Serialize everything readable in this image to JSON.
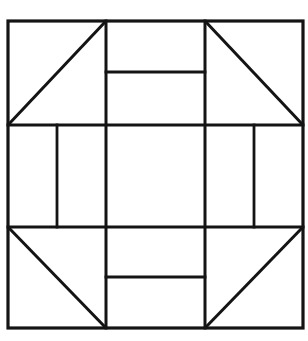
{
  "figure": {
    "background_color": "#ffffff",
    "line_color": "#141414",
    "canvas": {
      "width": 308,
      "height": 341
    },
    "bounds": {
      "left": 8,
      "top": 21,
      "right": 303,
      "bottom": 328
    },
    "grid": {
      "vertical_x": [
        106,
        205
      ],
      "horizontal_y": [
        125,
        227
      ]
    },
    "outer_border": {
      "name": "outer-square",
      "x": 8,
      "y": 21,
      "width": 295,
      "height": 307
    },
    "major_gridlines": [
      {
        "name": "horizontal-upper",
        "x1": 8,
        "y1": 125,
        "x2": 303,
        "y2": 125
      },
      {
        "name": "horizontal-lower",
        "x1": 8,
        "y1": 227,
        "x2": 303,
        "y2": 227
      },
      {
        "name": "vertical-left",
        "x1": 106,
        "y1": 21,
        "x2": 106,
        "y2": 328
      },
      {
        "name": "vertical-right",
        "x1": 205,
        "y1": 21,
        "x2": 205,
        "y2": 328
      }
    ],
    "diagonals": [
      {
        "name": "top-left-diagonal",
        "x1": 8,
        "y1": 125,
        "x2": 106,
        "y2": 21
      },
      {
        "name": "top-right-diagonal",
        "x1": 205,
        "y1": 21,
        "x2": 303,
        "y2": 125
      },
      {
        "name": "bottom-left-diagonal",
        "x1": 8,
        "y1": 227,
        "x2": 106,
        "y2": 328
      },
      {
        "name": "bottom-right-diagonal",
        "x1": 205,
        "y1": 328,
        "x2": 303,
        "y2": 227
      }
    ],
    "inner_bars": [
      {
        "name": "top-inner-bar",
        "x1": 106,
        "y1": 72,
        "x2": 205,
        "y2": 72
      },
      {
        "name": "bottom-inner-bar",
        "x1": 106,
        "y1": 277,
        "x2": 205,
        "y2": 277
      },
      {
        "name": "left-inner-bar",
        "x1": 57,
        "y1": 125,
        "x2": 57,
        "y2": 227
      },
      {
        "name": "right-inner-bar",
        "x1": 254,
        "y1": 125,
        "x2": 254,
        "y2": 227
      }
    ],
    "counts": {
      "triangles": 4,
      "rectangles": 9,
      "total_lines": 12
    }
  }
}
